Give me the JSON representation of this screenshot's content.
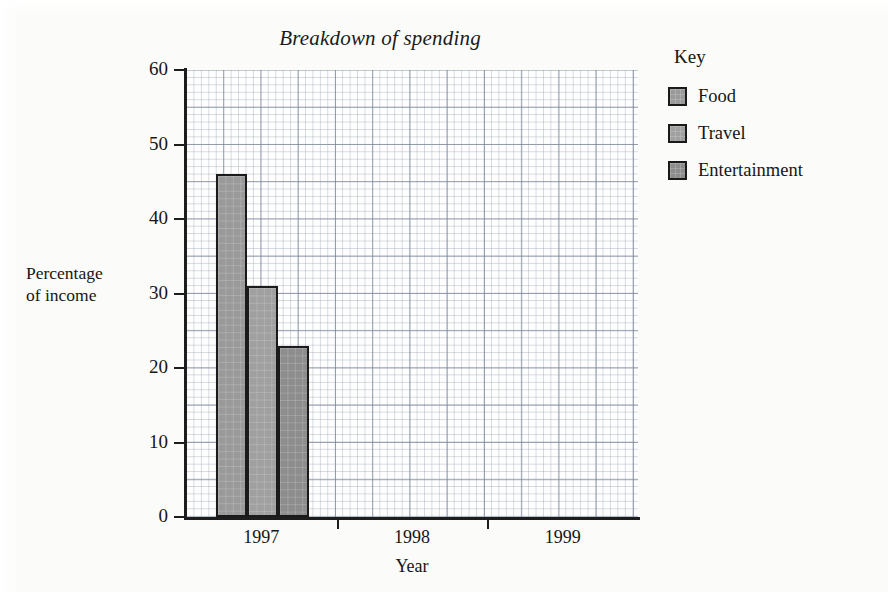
{
  "chart_data": {
    "type": "bar",
    "title": "Breakdown of spending",
    "xlabel": "Year",
    "ylabel_line1": "Percentage",
    "ylabel_line2": "of income",
    "categories": [
      "1997",
      "1998",
      "1999"
    ],
    "series": [
      {
        "name": "Food",
        "values": [
          46,
          null,
          null
        ],
        "color": "#9a9a9a"
      },
      {
        "name": "Travel",
        "values": [
          31,
          null,
          null
        ],
        "color": "#a0a0a0"
      },
      {
        "name": "Entertainment",
        "values": [
          23,
          null,
          null
        ],
        "color": "#8d8d8d"
      }
    ],
    "ylim": [
      0,
      60
    ],
    "ytick_labels": [
      "0",
      "10",
      "20",
      "30",
      "40",
      "50",
      "60"
    ],
    "ytick_values": [
      0,
      10,
      20,
      30,
      40,
      50,
      60
    ],
    "grid": true,
    "grid_style": "graph-paper",
    "legend_position": "right"
  },
  "legend": {
    "title": "Key",
    "entries": [
      {
        "label": "Food"
      },
      {
        "label": "Travel"
      },
      {
        "label": "Entertainment"
      }
    ]
  },
  "axes": {
    "y_title_line1": "Percentage",
    "y_title_line2": "of income",
    "x_title": "Year"
  }
}
